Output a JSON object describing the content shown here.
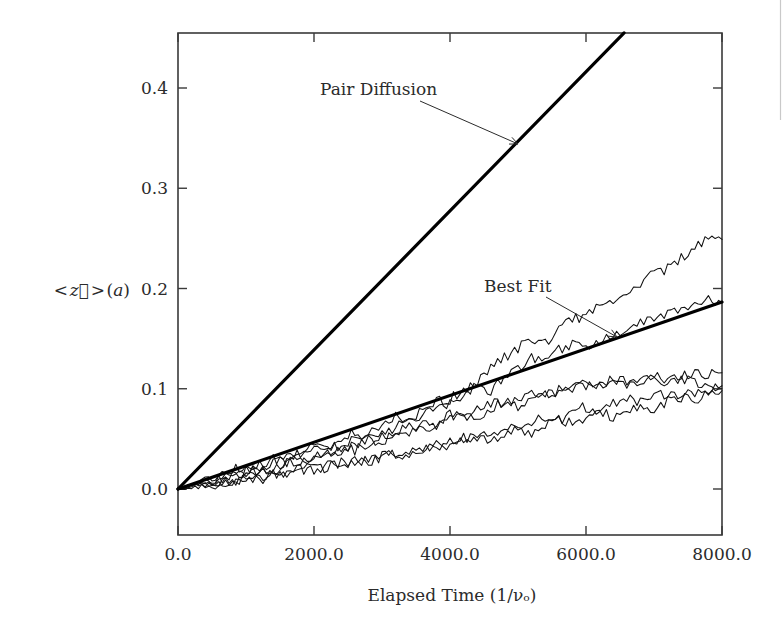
{
  "figure": {
    "background_color": "#ffffff",
    "ink_color": "#111111"
  },
  "axes": {
    "x_title": "Elapsed Time (1/νₒ)",
    "y_title": "< z⃗ > (a)",
    "x_ticks": [
      "0.0",
      "2000.0",
      "4000.0",
      "6000.0",
      "8000.0"
    ],
    "y_ticks": [
      "0.0",
      "0.1",
      "0.2",
      "0.3",
      "0.4"
    ]
  },
  "annotations": [
    {
      "label": "Pair Diffusion",
      "text_x": 320,
      "text_y": 95,
      "leader_from_x": 420,
      "leader_from_y": 101,
      "leader_to_x": 518,
      "leader_to_y": 144
    },
    {
      "label": "Best Fit",
      "text_x": 484,
      "text_y": 292,
      "leader_from_x": 546,
      "leader_from_y": 297,
      "leader_to_x": 617,
      "leader_to_y": 337
    }
  ],
  "chart_data": {
    "type": "line",
    "title": "",
    "xlabel": "Elapsed Time (1/νₒ)",
    "ylabel": "< z⃗ > (a)",
    "xlim": [
      0,
      8000
    ],
    "ylim": [
      0,
      0.455
    ],
    "grid": false,
    "legend": "none",
    "xtick_values": [
      0,
      2000,
      4000,
      6000,
      8000
    ],
    "ytick_values": [
      0.0,
      0.1,
      0.2,
      0.3,
      0.4
    ],
    "series": [
      {
        "name": "Pair Diffusion",
        "kind": "reference-line",
        "style": "thick-solid",
        "slope_per_unit_time": 6.94e-05,
        "x": [
          0,
          6560
        ],
        "values": [
          0.0,
          0.455
        ]
      },
      {
        "name": "Best Fit",
        "kind": "fit-line",
        "style": "thick-solid",
        "slope_per_unit_time": 2.33e-05,
        "x": [
          0,
          8000
        ],
        "values": [
          0.0,
          0.1865
        ]
      },
      {
        "name": "Trajectory 1",
        "kind": "random-walk",
        "x": [
          0,
          200,
          400,
          600,
          800,
          1000,
          1200,
          1400,
          1600,
          1800,
          2000,
          2200,
          2400,
          2600,
          2800,
          3000,
          3200,
          3400,
          3600,
          3800,
          4000,
          4200,
          4400,
          4600,
          4800,
          5000,
          5200,
          5400,
          5600,
          5800,
          6000,
          6200,
          6400,
          6600,
          6800,
          7000,
          7200,
          7400,
          7600,
          7800,
          8000
        ],
        "values": [
          0.0,
          0.004,
          0.01,
          0.013,
          0.019,
          0.023,
          0.021,
          0.028,
          0.034,
          0.031,
          0.038,
          0.044,
          0.041,
          0.049,
          0.055,
          0.053,
          0.062,
          0.07,
          0.074,
          0.081,
          0.09,
          0.098,
          0.108,
          0.12,
          0.131,
          0.141,
          0.15,
          0.146,
          0.158,
          0.17,
          0.173,
          0.181,
          0.19,
          0.196,
          0.205,
          0.214,
          0.22,
          0.231,
          0.241,
          0.251,
          0.249
        ]
      },
      {
        "name": "Trajectory 2",
        "kind": "random-walk",
        "x": [
          0,
          200,
          400,
          600,
          800,
          1000,
          1200,
          1400,
          1600,
          1800,
          2000,
          2200,
          2400,
          2600,
          2800,
          3000,
          3200,
          3400,
          3600,
          3800,
          4000,
          4200,
          4400,
          4600,
          4800,
          5000,
          5200,
          5400,
          5600,
          5800,
          6000,
          6200,
          6400,
          6600,
          6800,
          7000,
          7200,
          7400,
          7600,
          7800,
          8000
        ],
        "values": [
          0.0,
          0.006,
          0.003,
          0.011,
          0.018,
          0.015,
          0.024,
          0.03,
          0.027,
          0.036,
          0.043,
          0.04,
          0.048,
          0.057,
          0.053,
          0.063,
          0.072,
          0.068,
          0.078,
          0.088,
          0.084,
          0.095,
          0.104,
          0.099,
          0.11,
          0.121,
          0.13,
          0.126,
          0.139,
          0.145,
          0.138,
          0.148,
          0.154,
          0.16,
          0.166,
          0.172,
          0.176,
          0.181,
          0.186,
          0.19,
          0.186
        ]
      },
      {
        "name": "Trajectory 3",
        "kind": "random-walk",
        "x": [
          0,
          200,
          400,
          600,
          800,
          1000,
          1200,
          1400,
          1600,
          1800,
          2000,
          2200,
          2400,
          2600,
          2800,
          3000,
          3200,
          3400,
          3600,
          3800,
          4000,
          4200,
          4400,
          4600,
          4800,
          5000,
          5200,
          5400,
          5600,
          5800,
          6000,
          6200,
          6400,
          6600,
          6800,
          7000,
          7200,
          7400,
          7600,
          7800,
          8000
        ],
        "values": [
          0.0,
          0.003,
          0.008,
          0.006,
          0.013,
          0.018,
          0.016,
          0.022,
          0.028,
          0.026,
          0.033,
          0.039,
          0.037,
          0.044,
          0.05,
          0.048,
          0.056,
          0.062,
          0.059,
          0.067,
          0.074,
          0.071,
          0.079,
          0.086,
          0.083,
          0.09,
          0.096,
          0.093,
          0.099,
          0.104,
          0.101,
          0.105,
          0.109,
          0.106,
          0.11,
          0.113,
          0.11,
          0.114,
          0.117,
          0.114,
          0.116
        ]
      },
      {
        "name": "Trajectory 4",
        "kind": "random-walk",
        "x": [
          0,
          200,
          400,
          600,
          800,
          1000,
          1200,
          1400,
          1600,
          1800,
          2000,
          2200,
          2400,
          2600,
          2800,
          3000,
          3200,
          3400,
          3600,
          3800,
          4000,
          4200,
          4400,
          4600,
          4800,
          5000,
          5200,
          5400,
          5600,
          5800,
          6000,
          6200,
          6400,
          6600,
          6800,
          7000,
          7200,
          7400,
          7600,
          7800,
          8000
        ],
        "values": [
          0.0,
          0.002,
          0.006,
          0.01,
          0.007,
          0.014,
          0.02,
          0.017,
          0.025,
          0.031,
          0.028,
          0.036,
          0.042,
          0.039,
          0.047,
          0.053,
          0.05,
          0.058,
          0.064,
          0.061,
          0.069,
          0.075,
          0.072,
          0.08,
          0.086,
          0.083,
          0.091,
          0.097,
          0.094,
          0.101,
          0.105,
          0.102,
          0.107,
          0.103,
          0.108,
          0.111,
          0.107,
          0.11,
          0.106,
          0.102,
          0.1
        ]
      },
      {
        "name": "Trajectory 5",
        "kind": "random-walk",
        "x": [
          0,
          200,
          400,
          600,
          800,
          1000,
          1200,
          1400,
          1600,
          1800,
          2000,
          2200,
          2400,
          2600,
          2800,
          3000,
          3200,
          3400,
          3600,
          3800,
          4000,
          4200,
          4400,
          4600,
          4800,
          5000,
          5200,
          5400,
          5600,
          5800,
          6000,
          6200,
          6400,
          6600,
          6800,
          7000,
          7200,
          7400,
          7600,
          7800,
          8000
        ],
        "values": [
          0.0,
          0.001,
          0.004,
          0.002,
          0.007,
          0.011,
          0.009,
          0.015,
          0.012,
          0.018,
          0.023,
          0.02,
          0.027,
          0.024,
          0.03,
          0.035,
          0.032,
          0.038,
          0.043,
          0.04,
          0.047,
          0.052,
          0.049,
          0.056,
          0.062,
          0.059,
          0.066,
          0.072,
          0.069,
          0.076,
          0.082,
          0.079,
          0.086,
          0.09,
          0.087,
          0.092,
          0.096,
          0.093,
          0.097,
          0.1,
          0.103
        ]
      },
      {
        "name": "Trajectory 6",
        "kind": "random-walk",
        "x": [
          0,
          200,
          400,
          600,
          800,
          1000,
          1200,
          1400,
          1600,
          1800,
          2000,
          2200,
          2400,
          2600,
          2800,
          3000,
          3200,
          3400,
          3600,
          3800,
          4000,
          4200,
          4400,
          4600,
          4800,
          5000,
          5200,
          5400,
          5600,
          5800,
          6000,
          6200,
          6400,
          6600,
          6800,
          7000,
          7200,
          7400,
          7600,
          7800,
          8000
        ],
        "values": [
          0.0,
          0.005,
          0.002,
          0.008,
          0.005,
          0.012,
          0.009,
          0.016,
          0.013,
          0.02,
          0.017,
          0.024,
          0.021,
          0.028,
          0.025,
          0.032,
          0.036,
          0.033,
          0.04,
          0.044,
          0.041,
          0.048,
          0.052,
          0.049,
          0.056,
          0.06,
          0.057,
          0.064,
          0.068,
          0.065,
          0.072,
          0.076,
          0.073,
          0.08,
          0.084,
          0.081,
          0.088,
          0.092,
          0.089,
          0.094,
          0.098
        ]
      }
    ]
  }
}
